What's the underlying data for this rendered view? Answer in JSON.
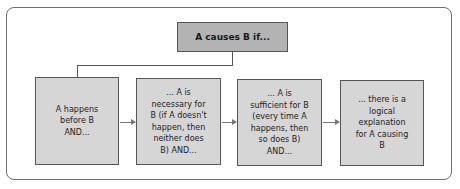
{
  "diagram": {
    "title": "A causes B if...",
    "steps": [
      {
        "label": "A happens\nbefore B\nAND..."
      },
      {
        "label": "... A is\nnecessary for\nB (if A doesn't\nhappen, then\nneither does\nB) AND..."
      },
      {
        "label": "... A is\nsufficient for B\n(every time A\nhappens, then\nso does B)\nAND..."
      },
      {
        "label": "... there is a\nlogical\nexplanation\nfor A causing\nB"
      }
    ],
    "connectors": [
      {
        "from": "title",
        "to": "step-1",
        "type": "elbow-line"
      },
      {
        "from": "step-1",
        "to": "step-2",
        "type": "arrow"
      },
      {
        "from": "step-2",
        "to": "step-3",
        "type": "arrow"
      },
      {
        "from": "step-3",
        "to": "step-4",
        "type": "arrow"
      }
    ],
    "colors": {
      "title_fill": "#b3b3b3",
      "step_fill": "#d6d6d6",
      "border": "#555555",
      "frame": "#6e6e6e"
    }
  }
}
